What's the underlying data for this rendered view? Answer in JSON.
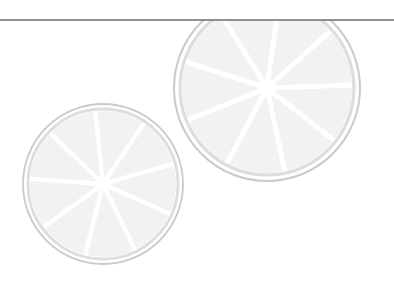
{
  "page": {
    "title": "Citrus Slice Decorative Graphic",
    "width": 394,
    "height": 297,
    "background_color": "#ffffff"
  },
  "palette": {
    "background": "#ffffff",
    "rule_line": "#6e6e72",
    "rind_ring": "#c9cac9",
    "rind_ring_inner": "#dcdddc",
    "pulp_fill": "#f1f2f1",
    "pulp_fill_light": "#f5f6f5",
    "segment_divider": "#ffffff",
    "pith_core": "#ffffff"
  },
  "divider": {
    "name": "horizontal-rule",
    "y": 20,
    "x_start": 0,
    "x_end": 394,
    "thickness": 1.4,
    "color": "#6e6e72",
    "label": "Horizontal rule"
  },
  "slices": [
    {
      "id": "citrus-slice-large",
      "label": "Large citrus slice",
      "center_x": 267,
      "center_y": 88,
      "radius": 93,
      "rind_outer_radius": 93,
      "rind_inner_radius": 87,
      "rind_stroke_width": 2.0,
      "pulp_radius": 85,
      "segment_count": 9,
      "start_angle_deg": -82,
      "divider_width": 5.0,
      "core_radius": 9,
      "clipped_top": true,
      "clip_y": 20
    },
    {
      "id": "citrus-slice-small",
      "label": "Small citrus slice",
      "center_x": 103,
      "center_y": 184,
      "radius": 80,
      "rind_outer_radius": 80,
      "rind_inner_radius": 75,
      "rind_stroke_width": 1.8,
      "pulp_radius": 73,
      "segment_count": 9,
      "start_angle_deg": -96,
      "divider_width": 4.4,
      "core_radius": 7,
      "clipped_top": false,
      "clip_y": 0
    }
  ]
}
